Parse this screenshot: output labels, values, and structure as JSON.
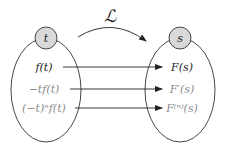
{
  "diagram": {
    "title_symbol": "ℒ",
    "domain_node": {
      "label": "t",
      "fill": "#d9d9d9"
    },
    "codomain_node": {
      "label": "s",
      "fill": "#d9d9d9"
    },
    "mappings": [
      {
        "from": "f(t)",
        "to": "F(s)",
        "emphasis": "primary"
      },
      {
        "from": "−tf(t)",
        "to": "F′(s)",
        "emphasis": "secondary"
      },
      {
        "from": "(−t)ⁿf(t)",
        "to": "F⁽ⁿ⁾(s)",
        "emphasis": "secondary"
      }
    ],
    "colors": {
      "stroke": "#333333",
      "primary_text": "#1a1a1a",
      "secondary_text": "#8c8c8c"
    }
  }
}
